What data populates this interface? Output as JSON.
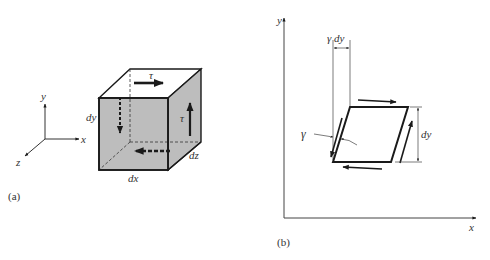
{
  "figure_a": {
    "caption": "(a)",
    "axes": {
      "x": "x",
      "y": "y",
      "z": "z"
    },
    "cube": {
      "dim_x": "dx",
      "dim_y": "dy",
      "dim_z": "dz",
      "stress_top": "τ",
      "stress_right": "τ",
      "face_color": "#bdbdbd"
    }
  },
  "figure_b": {
    "caption": "(b)",
    "axes": {
      "x": "x",
      "y": "y"
    },
    "angle_label": "γ",
    "offset_label": "γ dy",
    "height_label": "dy"
  },
  "colors": {
    "line": "#1a1a1a",
    "shade": "#bdbdbd",
    "text": "#333333"
  }
}
